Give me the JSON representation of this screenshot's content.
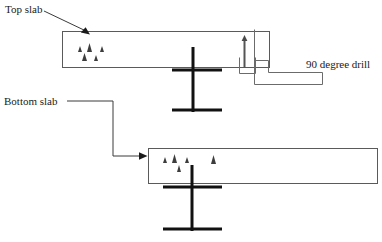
{
  "diagram": {
    "type": "engineering-section-diagram",
    "canvas": {
      "width": 382,
      "height": 242,
      "background": "#ffffff"
    },
    "colors": {
      "outline": "#5a5a5a",
      "beam": "#111111",
      "leader": "#3a3a3a",
      "text": "#1a1a1a",
      "drill": "#6b6b6b"
    },
    "labels": {
      "top_slab": "Top slab",
      "bottom_slab": "Bottom slab",
      "drill": "90 degree drill"
    },
    "parts": {
      "top_slab": {
        "name": "Top slab",
        "shape": "rectangle",
        "x": 62,
        "y": 31,
        "width": 208,
        "height": 37
      },
      "bottom_slab": {
        "name": "Bottom slab",
        "shape": "rectangle",
        "x": 148,
        "y": 148,
        "width": 230,
        "height": 36
      },
      "top_beam": {
        "name": "Top I-beam",
        "web_x": 193,
        "web_top": 47,
        "web_bottom": 112,
        "top_flange_y": 70,
        "top_flange_x1": 172,
        "top_flange_x2": 222,
        "bottom_flange_y": 110,
        "bottom_flange_x1": 172,
        "bottom_flange_x2": 222
      },
      "bottom_beam": {
        "name": "Bottom I-beam",
        "web_x": 192,
        "web_top": 165,
        "web_bottom": 231,
        "top_flange_y": 187,
        "top_flange_x1": 163,
        "top_flange_x2": 222,
        "bottom_flange_y": 229,
        "bottom_flange_x1": 163,
        "bottom_flange_x2": 222
      },
      "drill": {
        "name": "90 degree drill",
        "body_outline": "254,29 254,84 322,84 322,72 268,72 268,60 254,60",
        "bit_x": 244,
        "bit_top": 37,
        "bit_bottom": 68,
        "arrow_tip_y": 36,
        "housing_x": 239,
        "housing_y": 57,
        "housing_width": 16,
        "housing_height": 17
      }
    },
    "hatch_markers": {
      "top_slab": [
        {
          "x": 78,
          "y": 48,
          "size": 4
        },
        {
          "x": 88,
          "y": 45,
          "size": 7
        },
        {
          "x": 101,
          "y": 48,
          "size": 4
        },
        {
          "x": 83,
          "y": 56,
          "size": 6
        },
        {
          "x": 95,
          "y": 57,
          "size": 4
        }
      ],
      "bottom_slab": [
        {
          "x": 163,
          "y": 159,
          "size": 4
        },
        {
          "x": 173,
          "y": 156,
          "size": 7
        },
        {
          "x": 186,
          "y": 159,
          "size": 4
        },
        {
          "x": 178,
          "y": 167,
          "size": 5
        },
        {
          "x": 212,
          "y": 157,
          "size": 7
        }
      ]
    },
    "leaders": {
      "top_slab": {
        "points": "44,11 90,34",
        "arrow_at": {
          "x": 90,
          "y": 34
        },
        "arrow_dir": "down-right"
      },
      "bottom_slab": {
        "points": "67,101 113,101 113,156 146,156",
        "arrow_at": {
          "x": 146,
          "y": 156
        },
        "arrow_dir": "right"
      }
    }
  }
}
